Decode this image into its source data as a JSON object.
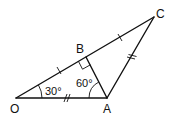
{
  "diagram": {
    "type": "geometry",
    "points": {
      "O": {
        "label": "O"
      },
      "A": {
        "label": "A"
      },
      "B": {
        "label": "B"
      },
      "C": {
        "label": "C"
      }
    },
    "segments": [
      "OA",
      "OB",
      "BC",
      "AB",
      "AC"
    ],
    "angles": {
      "BOA": {
        "label": "30°"
      },
      "OAB": {
        "label": "60°"
      },
      "OBA": {
        "label": "right-angle"
      }
    },
    "equal_marks": {
      "single": [
        "OB",
        "BC"
      ],
      "double": [
        "OA",
        "AC"
      ]
    }
  }
}
